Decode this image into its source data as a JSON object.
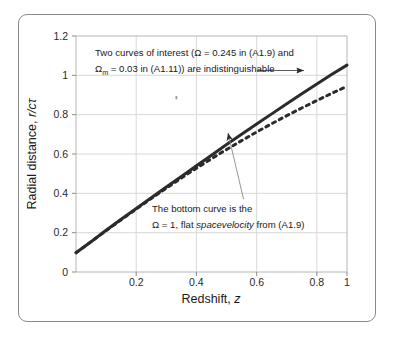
{
  "figure": {
    "border_color": "#8a8a8a",
    "background": "#ffffff"
  },
  "chart_data": {
    "type": "line",
    "title": "",
    "xlabel_prefix": "Redshift, ",
    "xlabel_symbol": "z",
    "ylabel_prefix": "Radial distance, ",
    "ylabel_symbol": "r/cτ",
    "xlim": [
      0.1,
      1.0
    ],
    "ylim": [
      0,
      1.2
    ],
    "xticks": [
      "0.2",
      "0.4",
      "0.6",
      "0.8",
      "1"
    ],
    "xtick_values": [
      0.2,
      0.4,
      0.6,
      0.8,
      1.0
    ],
    "yticks": [
      "0",
      "0.2",
      "0.4",
      "0.6",
      "0.8",
      "1",
      "1.2"
    ],
    "ytick_values": [
      0,
      0.2,
      0.4,
      0.6,
      0.8,
      1.0,
      1.2
    ],
    "grid": true,
    "grid_color": "#d8d8d8",
    "legend": "none",
    "series": [
      {
        "name": "Two curves of interest (Ω = 0.245 in (A1.9) and Ω_m = 0.03 in (A1.11))",
        "style": "solid",
        "color": "#2b2b2b",
        "width": 3.0,
        "x": [
          0.1,
          0.15,
          0.2,
          0.25,
          0.3,
          0.35,
          0.4,
          0.45,
          0.5,
          0.55,
          0.6,
          0.65,
          0.7,
          0.75,
          0.8,
          0.85,
          0.9,
          0.95,
          1.0
        ],
        "y": [
          0.098,
          0.154,
          0.212,
          0.268,
          0.323,
          0.378,
          0.432,
          0.486,
          0.54,
          0.594,
          0.648,
          0.7,
          0.752,
          0.804,
          0.855,
          0.906,
          0.956,
          1.005,
          1.052
        ]
      },
      {
        "name": "The bottom curve is the Ω = 1, flat spacevelocity from (A1.9)",
        "style": "dashed",
        "color": "#2b2b2b",
        "width": 3.0,
        "x": [
          0.1,
          0.15,
          0.2,
          0.25,
          0.3,
          0.35,
          0.4,
          0.45,
          0.5,
          0.55,
          0.6,
          0.65,
          0.7,
          0.75,
          0.8,
          0.85,
          0.9,
          0.95,
          1.0
        ],
        "y": [
          0.098,
          0.154,
          0.21,
          0.266,
          0.32,
          0.374,
          0.426,
          0.478,
          0.528,
          0.576,
          0.623,
          0.668,
          0.712,
          0.754,
          0.795,
          0.834,
          0.872,
          0.909,
          0.944
        ]
      }
    ],
    "annotations": [
      {
        "id": "top-annotation",
        "lines": [
          "Two curves of interest (Ω = 0.245 in (A1.9) and",
          "Ωₘ = 0.03 in (A1.11)) are indistinguishable"
        ],
        "line1": "Two curves of interest (Ω = 0.245 in (A1.9) and",
        "line2_pre": "Ω",
        "line2_sub": "m",
        "line2_post": " = 0.03 in (A1.11)) are indistinguishable",
        "arrow_to_curve": "solid"
      },
      {
        "id": "bottom-annotation",
        "lines": [
          "The bottom curve is the",
          "Ω = 1, flat spacevelocity from (A1.9)"
        ],
        "line1": "The bottom curve is the",
        "line2_pre": "Ω = 1, flat ",
        "line2_italic": "spacevelocity",
        "line2_post": " from (A1.9)",
        "arrow_to_curve": "dashed"
      }
    ]
  }
}
